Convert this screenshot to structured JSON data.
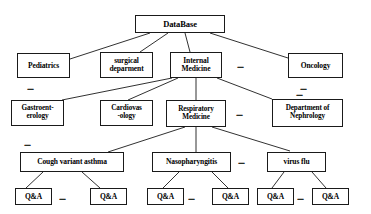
{
  "diagram": {
    "type": "hierarchy-tree",
    "levels": 5,
    "colors": {
      "box_border": "#1a1a1a",
      "box_fill": "#ffffff",
      "text": "#000000",
      "line": "#1a1a1a"
    },
    "nodes": {
      "root": {
        "label": "DataBase"
      },
      "level2": {
        "pediatrics": {
          "label": "Pediatrics"
        },
        "surgical": {
          "label_line1": "surgical",
          "label_line2": "deparment"
        },
        "internal": {
          "label_line1": "Internal",
          "label_line2": "Medicine"
        },
        "oncology": {
          "label": "Oncology"
        }
      },
      "level3": {
        "gastro": {
          "label_line1": "Gastroent-",
          "label_line2": "erology"
        },
        "cardio": {
          "label_line1": "Cardiovas",
          "label_line2": "-ology"
        },
        "respiratory": {
          "label_line1": "Respiratory",
          "label_line2": "Medicine"
        },
        "nephrology": {
          "label_line1": "Department of",
          "label_line2": "Nephrology"
        }
      },
      "level4": {
        "cough": {
          "label": "Cough variant asthma"
        },
        "naso": {
          "label": "Nasopharyngitis"
        },
        "flu": {
          "label": "virus flu"
        }
      },
      "level5": {
        "qa1": {
          "label": "Q&A"
        },
        "qa2": {
          "label": "Q&A"
        },
        "qa3": {
          "label": "Q&A"
        },
        "qa4": {
          "label": "Q&A"
        },
        "qa5": {
          "label": "Q&A"
        },
        "qa6": {
          "label": "Q&A"
        }
      }
    },
    "ellipses": {
      "e_row2_mid": {
        "label": "......"
      },
      "e_below_pediatrics": {
        "label": "......"
      },
      "e_below_oncology": {
        "label": "......"
      },
      "e_row3_mid": {
        "label": "......"
      },
      "e_below_nephrology": {
        "label": "......"
      },
      "e_row4_mid": {
        "label": "......"
      },
      "e_below_cough_left": {
        "label": "......"
      },
      "e_qa_group1": {
        "label": "......"
      },
      "e_qa_group2": {
        "label": "......"
      },
      "e_qa_group3": {
        "label": "......"
      }
    }
  }
}
